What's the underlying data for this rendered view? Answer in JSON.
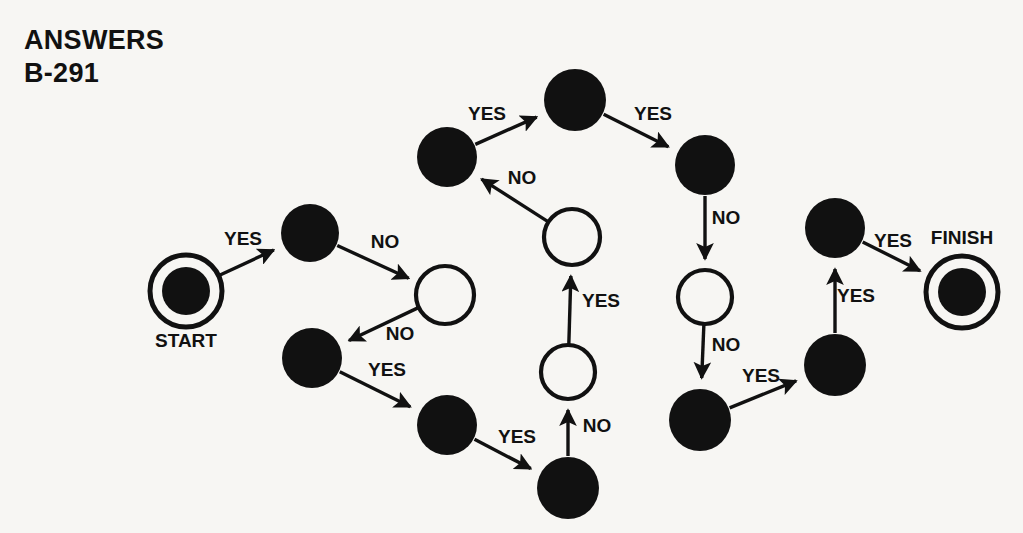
{
  "header": {
    "line1": "ANSWERS",
    "line2": "B-291"
  },
  "colors": {
    "background": "#f7f6f3",
    "ink": "#111111",
    "node_fill_black": "#111111",
    "node_fill_white": "#f7f6f3"
  },
  "chart_data": {
    "type": "diagram",
    "title": "ANSWERS B-291",
    "subtitle": "",
    "diagram_kind": "flowchart-graph",
    "legend": [],
    "terminals": [
      {
        "id": "start",
        "label": "START",
        "label_position": "below"
      },
      {
        "id": "finish",
        "label": "FINISH",
        "label_position": "above"
      }
    ],
    "node_styles": {
      "black": "filled black circle",
      "white": "white circle with black outline",
      "terminal": "black circle inside white ring inside black ring"
    },
    "nodes": [
      {
        "id": "start",
        "style": "terminal",
        "x": 186,
        "y": 291,
        "r": 36
      },
      {
        "id": "n1",
        "style": "black",
        "x": 310,
        "y": 233,
        "r": 29
      },
      {
        "id": "n2",
        "style": "white",
        "x": 445,
        "y": 295,
        "r": 29
      },
      {
        "id": "n3",
        "style": "black",
        "x": 312,
        "y": 358,
        "r": 30
      },
      {
        "id": "n4",
        "style": "black",
        "x": 447,
        "y": 425,
        "r": 30
      },
      {
        "id": "n5",
        "style": "black",
        "x": 568,
        "y": 488,
        "r": 31
      },
      {
        "id": "n6",
        "style": "white",
        "x": 568,
        "y": 372,
        "r": 27
      },
      {
        "id": "n7",
        "style": "white",
        "x": 572,
        "y": 237,
        "r": 28
      },
      {
        "id": "n8",
        "style": "black",
        "x": 447,
        "y": 157,
        "r": 30
      },
      {
        "id": "n9",
        "style": "black",
        "x": 575,
        "y": 100,
        "r": 31
      },
      {
        "id": "n10",
        "style": "black",
        "x": 705,
        "y": 165,
        "r": 30
      },
      {
        "id": "n11",
        "style": "white",
        "x": 705,
        "y": 297,
        "r": 27
      },
      {
        "id": "n12",
        "style": "black",
        "x": 700,
        "y": 420,
        "r": 31
      },
      {
        "id": "n13",
        "style": "black",
        "x": 835,
        "y": 365,
        "r": 31
      },
      {
        "id": "n14",
        "style": "black",
        "x": 835,
        "y": 228,
        "r": 30
      },
      {
        "id": "finish",
        "style": "terminal",
        "x": 962,
        "y": 292,
        "r": 36
      }
    ],
    "edges": [
      {
        "from": "start",
        "to": "n1",
        "label": "YES",
        "label_x": 243,
        "label_y": 245
      },
      {
        "from": "n1",
        "to": "n2",
        "label": "NO",
        "label_x": 385,
        "label_y": 248
      },
      {
        "from": "n2",
        "to": "n3",
        "label": "NO",
        "label_x": 400,
        "label_y": 340
      },
      {
        "from": "n3",
        "to": "n4",
        "label": "YES",
        "label_x": 387,
        "label_y": 376
      },
      {
        "from": "n4",
        "to": "n5",
        "label": "YES",
        "label_x": 517,
        "label_y": 443
      },
      {
        "from": "n5",
        "to": "n6",
        "label": "NO",
        "label_x": 597,
        "label_y": 432
      },
      {
        "from": "n6",
        "to": "n7",
        "label": "YES",
        "label_x": 601,
        "label_y": 307
      },
      {
        "from": "n7",
        "to": "n8",
        "label": "NO",
        "label_x": 522,
        "label_y": 184
      },
      {
        "from": "n8",
        "to": "n9",
        "label": "YES",
        "label_x": 487,
        "label_y": 120
      },
      {
        "from": "n9",
        "to": "n10",
        "label": "YES",
        "label_x": 653,
        "label_y": 120
      },
      {
        "from": "n10",
        "to": "n11",
        "label": "NO",
        "label_x": 726,
        "label_y": 224
      },
      {
        "from": "n11",
        "to": "n12",
        "label": "NO",
        "label_x": 726,
        "label_y": 351
      },
      {
        "from": "n12",
        "to": "n13",
        "label": "YES",
        "label_x": 761,
        "label_y": 382
      },
      {
        "from": "n13",
        "to": "n14",
        "label": "YES",
        "label_x": 856,
        "label_y": 302
      },
      {
        "from": "n14",
        "to": "finish",
        "label": "YES",
        "label_x": 893,
        "label_y": 247
      }
    ],
    "counts": {
      "black_nodes": 10,
      "white_nodes": 4,
      "terminal_nodes": 2,
      "yes_edges": 9,
      "no_edges": 6
    }
  }
}
